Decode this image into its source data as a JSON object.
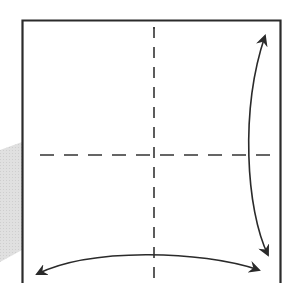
{
  "diagram": {
    "type": "origami-fold-step",
    "colors": {
      "background": "#ffffff",
      "paper_outline": "#2b2b2b",
      "fold_line": "#333333",
      "arrow": "#2a2a2a",
      "shadow": "#d9d9d9"
    },
    "paper": {
      "left": 22,
      "top": 20,
      "right": 280,
      "bottom": 283
    },
    "fold_lines": [
      {
        "id": "vertical",
        "style": "dashed",
        "x1": 154,
        "y1": 24,
        "x2": 154,
        "y2": 283
      },
      {
        "id": "horizontal",
        "style": "dashed",
        "x1": 40,
        "y1": 155,
        "x2": 275,
        "y2": 155
      }
    ],
    "arrows": [
      {
        "id": "right-vertical-arrow",
        "heads": "both",
        "from": [
          270,
          256
        ],
        "to": [
          264,
          36
        ],
        "bulge": "left"
      },
      {
        "id": "bottom-horizontal-arrow",
        "heads": "both",
        "from": [
          36,
          275
        ],
        "to": [
          260,
          271
        ],
        "bulge": "up"
      }
    ],
    "shadow": {
      "points": [
        [
          0,
          150
        ],
        [
          22,
          142
        ],
        [
          22,
          250
        ],
        [
          0,
          262
        ]
      ]
    }
  }
}
